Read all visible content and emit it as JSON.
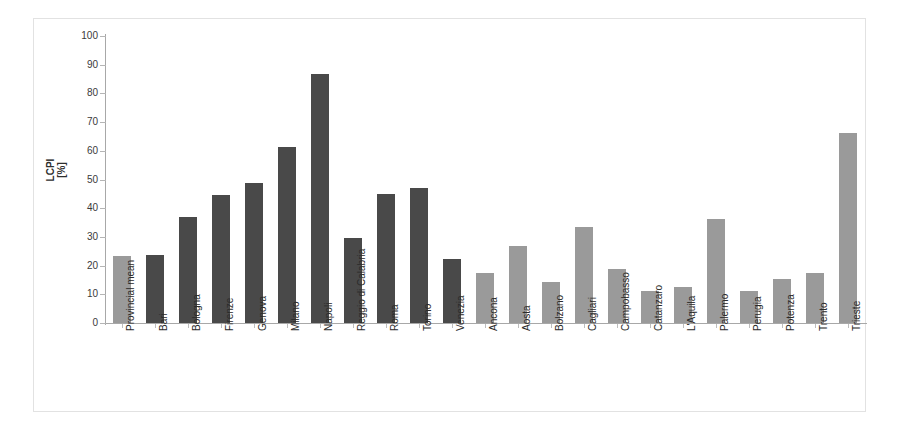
{
  "chart_data": {
    "type": "bar",
    "title": "",
    "subtitle": "",
    "xlabel": "",
    "ylabel": "LCPI\n[%]",
    "ylim": [
      0,
      100
    ],
    "ytick_labels": [
      "100",
      "90",
      "80",
      "70",
      "60",
      "50",
      "40",
      "30",
      "20",
      "10",
      "0"
    ],
    "ytick_values": [
      100,
      90,
      80,
      70,
      60,
      50,
      40,
      30,
      20,
      10,
      0
    ],
    "grid": false,
    "legend": "none",
    "categories": [
      "Provincial mean",
      "Bari",
      "Bologna",
      "Firenze",
      "Genova",
      "Milano",
      "Napoli",
      "Reggio di Calabria",
      "Roma",
      "Torino",
      "Venezia",
      "Ancona",
      "Aosta",
      "Bolzano",
      "Cagliari",
      "Campobasso",
      "Catanzaro",
      "L'Aquila",
      "Palermo",
      "Perugia",
      "Potenza",
      "Trento",
      "Trieste"
    ],
    "values": [
      23.5,
      23.8,
      36.8,
      44.7,
      48.8,
      61.3,
      86.9,
      29.5,
      45.0,
      47.0,
      22.2,
      17.3,
      26.8,
      14.3,
      33.4,
      18.9,
      11.3,
      12.6,
      36.4,
      11.1,
      15.4,
      17.5,
      66.3
    ],
    "bar_colors": [
      "#9a9a9a",
      "#494949",
      "#494949",
      "#494949",
      "#494949",
      "#494949",
      "#494949",
      "#494949",
      "#494949",
      "#494949",
      "#494949",
      "#9a9a9a",
      "#9a9a9a",
      "#9a9a9a",
      "#9a9a9a",
      "#9a9a9a",
      "#9a9a9a",
      "#9a9a9a",
      "#9a9a9a",
      "#9a9a9a",
      "#9a9a9a",
      "#9a9a9a",
      "#9a9a9a"
    ],
    "colors": {
      "light_gray_bar": "#9a9a9a",
      "dark_gray_bar": "#494949",
      "axis": "#a8a8a8",
      "frame_border": "#e2e2e2",
      "background": "#ffffff",
      "tick_text": "#3a3a3a"
    }
  }
}
